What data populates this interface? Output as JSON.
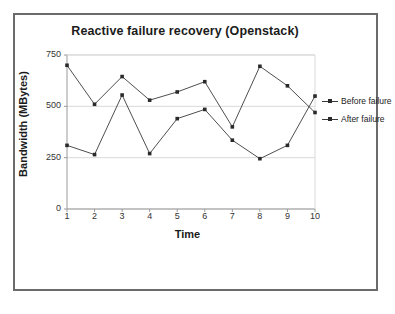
{
  "chart_data": {
    "type": "line",
    "title": "Reactive failure recovery (Openstack)",
    "xlabel": "Time",
    "ylabel": "Bandwidth (MBytes)",
    "categories": [
      "1",
      "2",
      "3",
      "4",
      "5",
      "6",
      "7",
      "8",
      "9",
      "10"
    ],
    "x": [
      1,
      2,
      3,
      4,
      5,
      6,
      7,
      8,
      9,
      10
    ],
    "series": [
      {
        "name": "Before failure",
        "values": [
          700,
          510,
          645,
          530,
          570,
          620,
          400,
          695,
          600,
          470
        ],
        "color": "#3a3a3a",
        "marker": "square"
      },
      {
        "name": "After failure",
        "values": [
          310,
          265,
          555,
          270,
          440,
          485,
          335,
          245,
          310,
          550
        ],
        "color": "#3a3a3a",
        "marker": "square"
      }
    ],
    "ylim": [
      0,
      750
    ],
    "yticks": [
      "0",
      "250",
      "500",
      "750"
    ],
    "ytick_values": [
      0,
      250,
      500,
      750
    ],
    "xlim": [
      1,
      10
    ],
    "grid": "horizontal",
    "legend_position": "right",
    "plot_background": "#ffffff",
    "grid_color": "#d9d9d9",
    "axis_color": "#9a9a9a",
    "frame_color": "#6b6b6b"
  },
  "legend": {
    "items": [
      {
        "label": "Before failure"
      },
      {
        "label": "After failure"
      }
    ]
  }
}
